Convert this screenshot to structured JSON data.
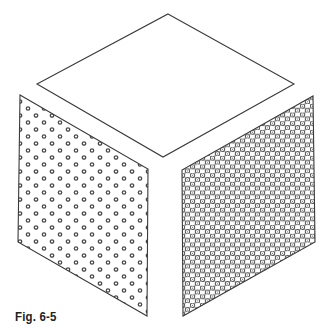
{
  "figure": {
    "caption": "Fig. 6-5"
  },
  "faces": {
    "top": {
      "points": [
        [
          168,
          14
        ],
        [
          294,
          84
        ],
        [
          163,
          157
        ],
        [
          37,
          84
        ]
      ],
      "fill": "none",
      "texture": "plain"
    },
    "left": {
      "points": [
        [
          20,
          95
        ],
        [
          148,
          169
        ],
        [
          147,
          316
        ],
        [
          18,
          242
        ]
      ],
      "texture": "sparse-ring-dots"
    },
    "right": {
      "points": [
        [
          313,
          96
        ],
        [
          315,
          242
        ],
        [
          183,
          316
        ],
        [
          182,
          170
        ]
      ],
      "texture": "dense-hex-rings"
    }
  },
  "colors": {
    "stroke": "#3a3a3a",
    "dot": "#4a4a4a",
    "background": "#ffffff"
  }
}
